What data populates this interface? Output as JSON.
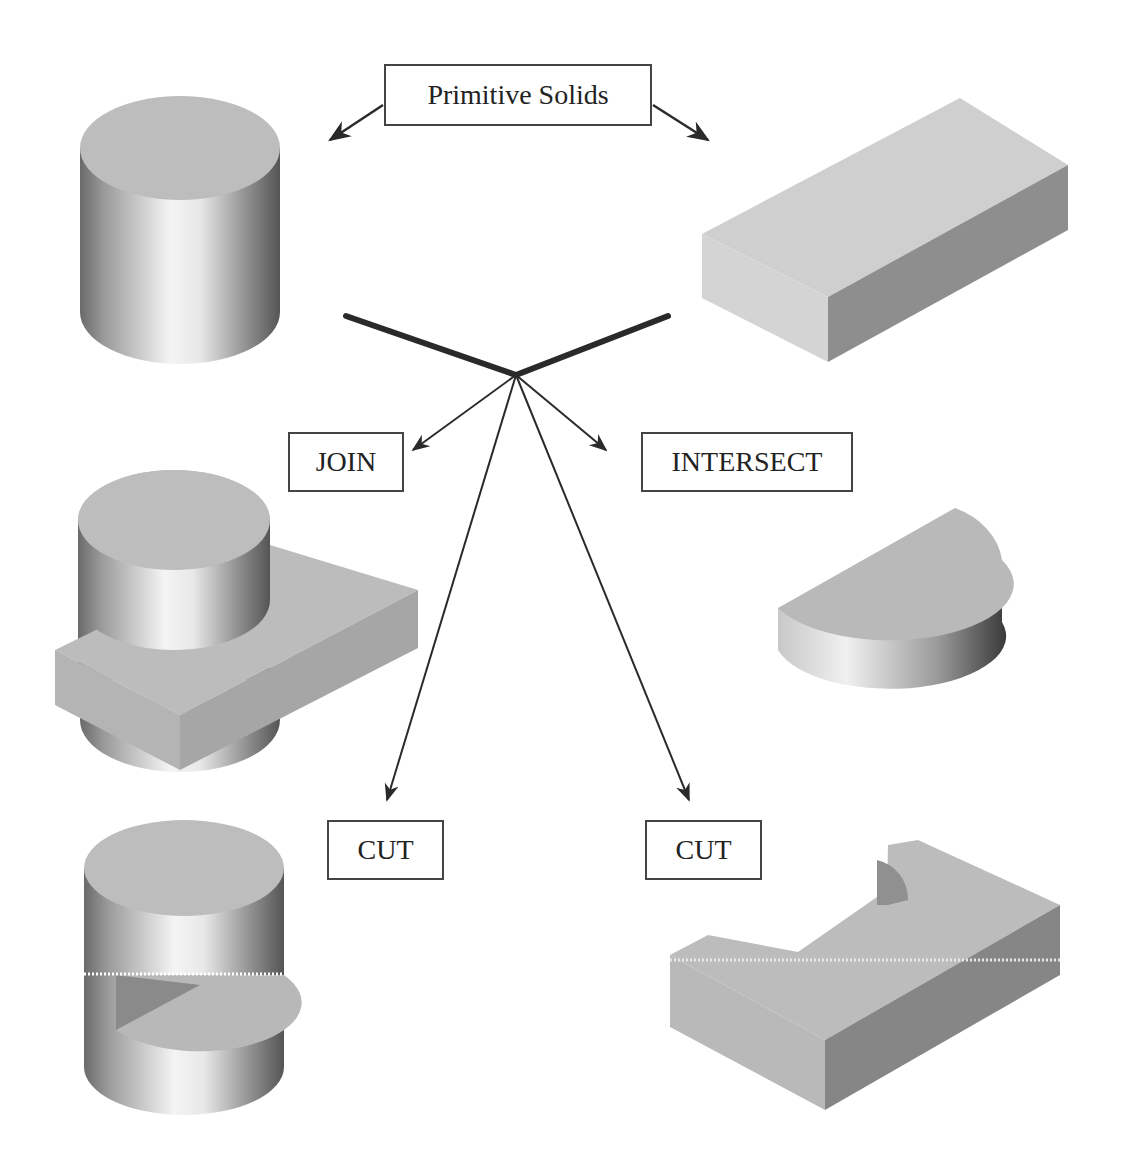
{
  "diagram": {
    "title_label": "Primitive Solids",
    "operations": {
      "join": "JOIN",
      "intersect": "INTERSECT",
      "cut_left": "CUT",
      "cut_right": "CUT"
    },
    "shapes": {
      "primitive_1": "cylinder",
      "primitive_2": "rectangular-block",
      "join_result": "cylinder-joined-with-block",
      "intersect_result": "half-cylinder",
      "cut_left_result": "cylinder-with-wedge-cut",
      "cut_right_result": "block-with-semicircular-cut"
    },
    "colors": {
      "arrow": "#2a2a2a",
      "box_border": "#444444",
      "top_face": "#bdbdbd",
      "light_face": "#d2d2d2",
      "dark_face": "#8e8e8e"
    }
  }
}
